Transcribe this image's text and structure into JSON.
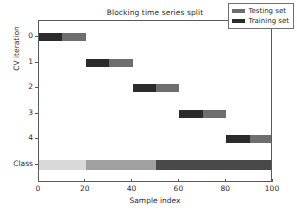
{
  "chart_data": {
    "type": "bar",
    "title": "Blocking time series split",
    "xlabel": "Sample index",
    "ylabel": "CV iteration",
    "xlim": [
      0,
      100
    ],
    "xticks": [
      0,
      20,
      40,
      60,
      80,
      100
    ],
    "xticklabels": [
      "0",
      "20",
      "40",
      "60",
      "80",
      "100"
    ],
    "yticklabels": [
      "0",
      "1",
      "2",
      "3",
      "4",
      "Class"
    ],
    "grid": false,
    "legend": {
      "position": "upper right",
      "entries": [
        {
          "label": "Testing set",
          "color": "#6e6e6e"
        },
        {
          "label": "Training set",
          "color": "#2b2b2b"
        }
      ]
    },
    "colors": {
      "training": "#2b2b2b",
      "testing": "#6e6e6e",
      "class_0": "#d9d9d9",
      "class_1": "#a0a0a0",
      "class_2": "#494949"
    },
    "rows": [
      {
        "name": "cv-iteration-0",
        "ylabel": "0",
        "segments": [
          {
            "name": "Training set",
            "start": 0,
            "end": 10,
            "color": "#2b2b2b"
          },
          {
            "name": "Testing set",
            "start": 10,
            "end": 20,
            "color": "#6e6e6e"
          }
        ]
      },
      {
        "name": "cv-iteration-1",
        "ylabel": "1",
        "segments": [
          {
            "name": "Training set",
            "start": 20,
            "end": 30,
            "color": "#2b2b2b"
          },
          {
            "name": "Testing set",
            "start": 30,
            "end": 40,
            "color": "#6e6e6e"
          }
        ]
      },
      {
        "name": "cv-iteration-2",
        "ylabel": "2",
        "segments": [
          {
            "name": "Training set",
            "start": 40,
            "end": 50,
            "color": "#2b2b2b"
          },
          {
            "name": "Testing set",
            "start": 50,
            "end": 60,
            "color": "#6e6e6e"
          }
        ]
      },
      {
        "name": "cv-iteration-3",
        "ylabel": "3",
        "segments": [
          {
            "name": "Training set",
            "start": 60,
            "end": 70,
            "color": "#2b2b2b"
          },
          {
            "name": "Testing set",
            "start": 70,
            "end": 80,
            "color": "#6e6e6e"
          }
        ]
      },
      {
        "name": "cv-iteration-4",
        "ylabel": "4",
        "segments": [
          {
            "name": "Training set",
            "start": 80,
            "end": 90,
            "color": "#2b2b2b"
          },
          {
            "name": "Testing set",
            "start": 90,
            "end": 100,
            "color": "#6e6e6e"
          }
        ]
      },
      {
        "name": "class-row",
        "ylabel": "Class",
        "segments": [
          {
            "name": "Class 0",
            "start": 0,
            "end": 20,
            "color": "#d9d9d9"
          },
          {
            "name": "Class 1",
            "start": 20,
            "end": 50,
            "color": "#a0a0a0"
          },
          {
            "name": "Class 2",
            "start": 50,
            "end": 100,
            "color": "#494949"
          }
        ]
      }
    ]
  }
}
